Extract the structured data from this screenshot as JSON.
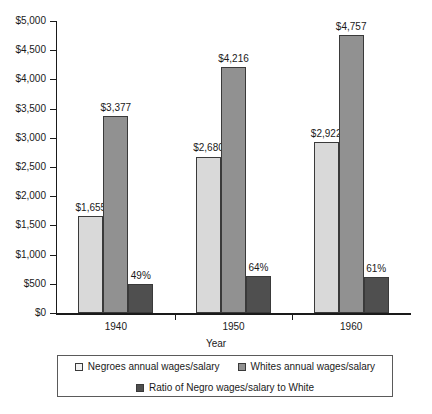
{
  "chart_data": {
    "type": "bar",
    "title": "",
    "subtitle": "",
    "xlabel": "Year",
    "ylabel": "",
    "categories": [
      "1940",
      "1950",
      "1960"
    ],
    "ylim": [
      0,
      5000
    ],
    "ytick_values": [
      0,
      500,
      1000,
      1500,
      2000,
      2500,
      3000,
      3500,
      4000,
      4500,
      5000
    ],
    "ytick_labels": [
      "$0",
      "$500",
      "$1,000",
      "$1,500",
      "$2,000",
      "$2,500",
      "$3,000",
      "$3,500",
      "$4,000",
      "$4,500",
      "$5,000"
    ],
    "grid": false,
    "legend_position": "bottom",
    "series": [
      {
        "name": "Negroes annual wages/salary",
        "color": "#d9d9d9",
        "values": [
          1655,
          2680,
          2922
        ],
        "data_labels": [
          "$1,655",
          "$2,680",
          "$2,922"
        ]
      },
      {
        "name": "Whites annual wages/salary",
        "color": "#919191",
        "values": [
          3377,
          4216,
          4757
        ],
        "data_labels": [
          "$3,377",
          "$4,216",
          "$4,757"
        ]
      },
      {
        "name": "Ratio of Negro wages/salary to White",
        "color": "#4f4f4f",
        "values": [
          490,
          640,
          610
        ],
        "data_labels": [
          "49%",
          "64%",
          "61%"
        ]
      }
    ]
  }
}
